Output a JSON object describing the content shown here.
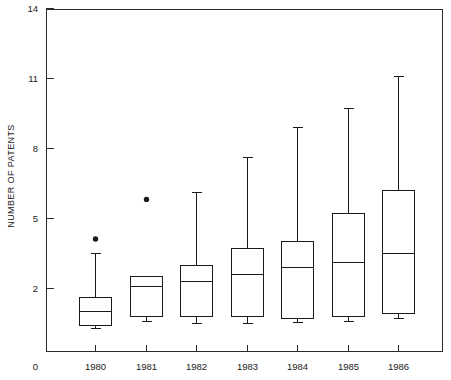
{
  "chart_data": {
    "type": "box",
    "title": "",
    "subtitle": "",
    "xlabel": "",
    "ylabel": "NUMBER OF PATENTS",
    "categories": [
      "1980",
      "1981",
      "1982",
      "1983",
      "1984",
      "1985",
      "1986"
    ],
    "ylim": [
      0,
      14
    ],
    "y_ticks": [
      0,
      2,
      5,
      8,
      11,
      14
    ],
    "y_tick_labels": [
      "0",
      "2",
      "5",
      "8",
      "11",
      "14"
    ],
    "x_tick_labels": [
      "1980",
      "1981",
      "1982",
      "1983",
      "1984",
      "1985",
      "1986"
    ],
    "grid": false,
    "legend": "none",
    "axis_color": "#2b2b2b",
    "box_color": "#1a1a1a",
    "boxes": [
      {
        "category": "1980",
        "whisker_low": 0.3,
        "q1": 0.4,
        "median": 1.0,
        "q3": 1.6,
        "whisker_high": 3.5,
        "outliers": [
          4.1
        ]
      },
      {
        "category": "1981",
        "whisker_low": 0.6,
        "q1": 0.8,
        "median": 2.1,
        "q3": 2.5,
        "whisker_high": 2.5,
        "outliers": [
          5.8
        ]
      },
      {
        "category": "1982",
        "whisker_low": 0.5,
        "q1": 0.8,
        "median": 2.3,
        "q3": 3.0,
        "whisker_high": 6.1,
        "outliers": []
      },
      {
        "category": "1983",
        "whisker_low": 0.5,
        "q1": 0.8,
        "median": 2.6,
        "q3": 3.7,
        "whisker_high": 7.6,
        "outliers": []
      },
      {
        "category": "1984",
        "whisker_low": 0.55,
        "q1": 0.7,
        "median": 2.9,
        "q3": 4.0,
        "whisker_high": 8.9,
        "outliers": []
      },
      {
        "category": "1985",
        "whisker_low": 0.6,
        "q1": 0.8,
        "median": 3.1,
        "q3": 5.2,
        "whisker_high": 9.7,
        "outliers": []
      },
      {
        "category": "1986",
        "whisker_low": 0.7,
        "q1": 0.95,
        "median": 3.5,
        "q3": 6.2,
        "whisker_high": 11.1,
        "outliers": []
      }
    ]
  }
}
